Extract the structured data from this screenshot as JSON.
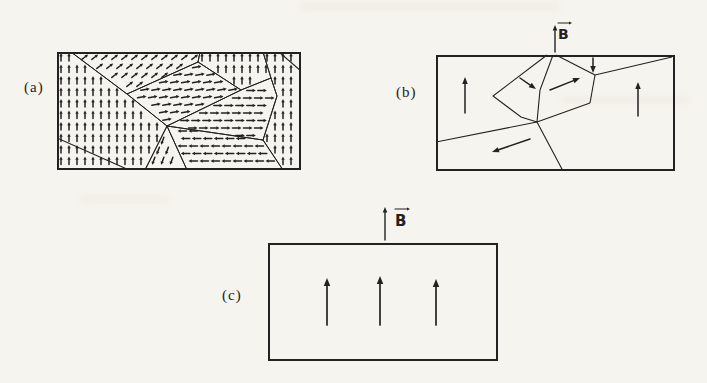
{
  "page": {
    "background": "#f6f4ee",
    "ink": "#222222"
  },
  "panels": [
    {
      "id": "a",
      "label": "(a)",
      "pos": {
        "x": 57,
        "y": 52,
        "w": 244,
        "h": 118
      },
      "label_pos": {
        "x": 24,
        "y": 78
      },
      "rect": {
        "x": 0,
        "y": 0,
        "w": 244,
        "h": 118
      },
      "small_arrow": {
        "sw": 1.5,
        "hl": 3.2,
        "hw": 3.4
      },
      "domains": [
        {
          "name": "left-up",
          "angle": 90,
          "sx": 8,
          "sy": 11.5,
          "len": 8,
          "stagger": 0,
          "poly": [
            [
              0,
              0
            ],
            [
              14,
              0
            ],
            [
              70,
              42
            ],
            [
              110,
              74
            ],
            [
              88,
              118
            ],
            [
              0,
              118
            ]
          ]
        },
        {
          "name": "top-left-diagonal-up-right",
          "angle": 38,
          "sx": 10,
          "sy": 9,
          "len": 8,
          "stagger": 0.5,
          "poly": [
            [
              14,
              0
            ],
            [
              143,
              0
            ],
            [
              141,
              10
            ],
            [
              70,
              42
            ]
          ]
        },
        {
          "name": "center-left-right",
          "angle": 10,
          "sx": 11,
          "sy": 7.5,
          "len": 9,
          "stagger": 0.3,
          "poly": [
            [
              70,
              42
            ],
            [
              141,
              10
            ],
            [
              184,
              38
            ],
            [
              110,
              74
            ]
          ]
        },
        {
          "name": "top-center-up",
          "angle": 90,
          "sx": 8,
          "sy": 11.5,
          "len": 8,
          "stagger": 0,
          "poly": [
            [
              143,
              0
            ],
            [
              206,
              0
            ],
            [
              214,
              26
            ],
            [
              184,
              38
            ],
            [
              141,
              10
            ]
          ]
        },
        {
          "name": "right-up",
          "angle": 90,
          "sx": 8,
          "sy": 11.5,
          "len": 8,
          "stagger": 0,
          "poly": [
            [
              206,
              0
            ],
            [
              244,
              0
            ],
            [
              244,
              118
            ],
            [
              226,
              118
            ],
            [
              206,
              88
            ],
            [
              220,
              44
            ],
            [
              214,
              26
            ]
          ]
        },
        {
          "name": "center-right-right",
          "angle": 0,
          "sx": 11,
          "sy": 7.5,
          "len": 9,
          "stagger": 0.3,
          "poly": [
            [
              110,
              74
            ],
            [
              184,
              38
            ],
            [
              214,
              26
            ],
            [
              220,
              44
            ],
            [
              206,
              88
            ]
          ]
        },
        {
          "name": "bottom-center-left",
          "angle": 180,
          "sx": 11,
          "sy": 7.5,
          "len": 9,
          "stagger": 0.3,
          "poly": [
            [
              110,
              74
            ],
            [
              206,
              88
            ],
            [
              226,
              118
            ],
            [
              130,
              118
            ]
          ]
        },
        {
          "name": "bottom-band-down-left",
          "angle": 250,
          "sx": 9,
          "sy": 10,
          "len": 8,
          "stagger": 0.5,
          "poly": [
            [
              110,
              74
            ],
            [
              130,
              118
            ],
            [
              88,
              118
            ]
          ]
        }
      ],
      "extra_walls": [
        [
          [
            0,
            86
          ],
          [
            72,
            118
          ]
        ],
        [
          [
            222,
            0
          ],
          [
            244,
            19
          ]
        ]
      ]
    },
    {
      "id": "b",
      "label": "(b)",
      "pos": {
        "x": 436,
        "y": 18,
        "w": 239,
        "h": 153
      },
      "label_pos": {
        "x": 396,
        "y": 83
      },
      "rect": {
        "x": 0,
        "y": 37,
        "w": 239,
        "h": 116
      },
      "walls": [
        [
          [
            111,
            37
          ],
          [
            57,
            78
          ],
          [
            85,
            99
          ],
          [
            101,
            104
          ]
        ],
        [
          [
            117,
            37
          ],
          [
            104,
            72
          ],
          [
            101,
            104
          ]
        ],
        [
          [
            120,
            37
          ],
          [
            159,
            57
          ]
        ],
        [
          [
            159,
            57
          ],
          [
            154,
            85
          ]
        ],
        [
          [
            154,
            85
          ],
          [
            101,
            104
          ]
        ],
        [
          [
            159,
            57
          ],
          [
            236,
            39
          ]
        ],
        [
          [
            0,
            124
          ],
          [
            101,
            104
          ]
        ],
        [
          [
            101,
            104
          ],
          [
            127,
            153
          ]
        ]
      ],
      "big_arrow": {
        "sw": 1.5,
        "hl": 7,
        "hw": 5.5
      },
      "arrows": [
        {
          "name": "up-left-domain",
          "x1": 29,
          "y1": 95,
          "x2": 29,
          "y2": 59
        },
        {
          "name": "down-right-small",
          "x1": 84,
          "y1": 60,
          "x2": 100,
          "y2": 71
        },
        {
          "name": "up-right-pentagon",
          "x1": 114,
          "y1": 72,
          "x2": 144,
          "y2": 60
        },
        {
          "name": "down-small",
          "x1": 157,
          "y1": 40,
          "x2": 157,
          "y2": 55
        },
        {
          "name": "up-right-domain",
          "x1": 202,
          "y1": 98,
          "x2": 202,
          "y2": 64
        },
        {
          "name": "left-bottom-domain",
          "x1": 94,
          "y1": 121,
          "x2": 56,
          "y2": 134
        }
      ],
      "field": {
        "label": "B",
        "size": 14,
        "arrow": {
          "x": 119,
          "y1": 34,
          "y2": 7
        },
        "label_x": 122,
        "label_y": 21,
        "vec": {
          "x1": 122,
          "y1": 5,
          "x2": 136,
          "y2": 5
        }
      }
    },
    {
      "id": "c",
      "label": "(c)",
      "pos": {
        "x": 268,
        "y": 200,
        "w": 230,
        "h": 161
      },
      "label_pos": {
        "x": 222,
        "y": 286
      },
      "rect": {
        "x": 0,
        "y": 43,
        "w": 230,
        "h": 118
      },
      "big_arrow": {
        "sw": 1.7,
        "hl": 8,
        "hw": 6.5
      },
      "arrows": [
        {
          "name": "up-1",
          "x1": 59,
          "y1": 125,
          "x2": 59,
          "y2": 78
        },
        {
          "name": "up-2",
          "x1": 112,
          "y1": 125,
          "x2": 112,
          "y2": 76
        },
        {
          "name": "up-3",
          "x1": 168,
          "y1": 125,
          "x2": 168,
          "y2": 79
        }
      ],
      "field": {
        "label": "B",
        "size": 15,
        "arrow": {
          "x": 117,
          "y1": 40,
          "y2": 7
        },
        "label_x": 127,
        "label_y": 26,
        "vec": {
          "x1": 127,
          "y1": 9,
          "x2": 142,
          "y2": 9
        }
      }
    }
  ]
}
